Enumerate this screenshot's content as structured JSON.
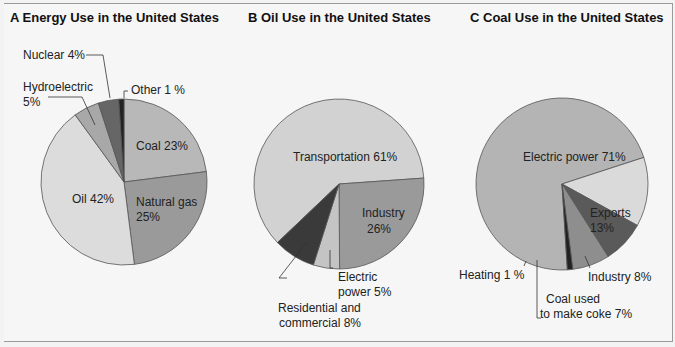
{
  "chart_data": [
    {
      "type": "pie",
      "title": "A  Energy Use in the United States",
      "categories": [
        "Coal",
        "Natural gas",
        "Oil",
        "Hydroelectric",
        "Nuclear",
        "Other"
      ],
      "values": [
        23,
        25,
        42,
        5,
        4,
        1
      ],
      "unit": "%",
      "labels": [
        "Coal 23%",
        "Natural gas 25%",
        "Oil 42%",
        "Hydroelectric 5%",
        "Nuclear 4%",
        "Other 1 %"
      ],
      "colors": [
        "#b8b8b8",
        "#9a9a9a",
        "#dcdcdc",
        "#aaaaaa",
        "#666666",
        "#222222"
      ]
    },
    {
      "type": "pie",
      "title": "B  Oil Use in the United States",
      "categories": [
        "Transportation",
        "Industry",
        "Electric power",
        "Residential and commercial"
      ],
      "values": [
        61,
        26,
        5,
        8
      ],
      "unit": "%",
      "labels": [
        "Transportation 61%",
        "Industry 26%",
        "Electric power 5%",
        "Residential and commercial 8%"
      ],
      "colors": [
        "#d2d2d2",
        "#9a9a9a",
        "#c0c0c0",
        "#3a3a3a"
      ]
    },
    {
      "type": "pie",
      "title": "C  Coal Use in the United States",
      "categories": [
        "Electric power",
        "Exports",
        "Industry",
        "Coal used to make coke",
        "Heating"
      ],
      "values": [
        71,
        13,
        8,
        7,
        1
      ],
      "unit": "%",
      "labels": [
        "Electric power 71%",
        "Exports 13%",
        "Industry 8%",
        "Coal used to make coke 7%",
        "Heating 1 %"
      ],
      "colors": [
        "#b4b4b4",
        "#dadada",
        "#5a5a5a",
        "#8e8e8e",
        "#222222"
      ]
    }
  ],
  "panels": {
    "a": {
      "title": "A  Energy Use in the United States",
      "coal": "Coal 23%",
      "gas1": "Natural gas",
      "gas2": "25%",
      "oil": "Oil 42%",
      "hydro1": "Hydroelectric",
      "hydro2": "5%",
      "nuclear": "Nuclear 4%",
      "other": "Other 1 %"
    },
    "b": {
      "title": "B  Oil Use in the United States",
      "transport": "Transportation 61%",
      "industry1": "Industry",
      "industry2": "26%",
      "electric1": "Electric",
      "electric2": "power 5%",
      "res1": "Residential and",
      "res2": "commercial 8%"
    },
    "c": {
      "title": "C  Coal Use in the United States",
      "electric": "Electric power 71%",
      "exports1": "Exports",
      "exports2": "13%",
      "industry": "Industry 8%",
      "coke1": "Coal used",
      "coke2": "to make coke 7%",
      "heating": "Heating 1 %"
    }
  }
}
